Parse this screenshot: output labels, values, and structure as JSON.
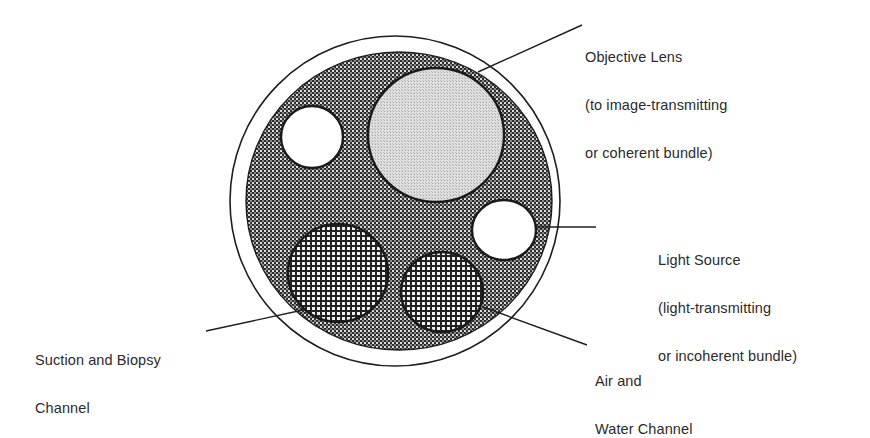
{
  "diagram": {
    "colors": {
      "background": "#ffffff",
      "stroke": "#1e1e1e",
      "matrix_fill_dark": "#3a3a3a",
      "matrix_fill_light": "#d8d8d8",
      "lens_fill": "#d6d6d6",
      "channel_fill": "#e8e8e8",
      "white_fill": "#ffffff"
    },
    "labels": {
      "objective_lens": {
        "line1": "Objective Lens",
        "line2": "(to image-transmitting",
        "line3": "or coherent bundle)"
      },
      "light_source": {
        "line1": "Light Source",
        "line2": "(light-transmitting",
        "line3": "or incoherent bundle)"
      },
      "suction_biopsy": {
        "line1": "Suction and Biopsy",
        "line2": "Channel"
      },
      "air_water": {
        "line1": "Air and",
        "line2": "Water Channel"
      }
    }
  }
}
